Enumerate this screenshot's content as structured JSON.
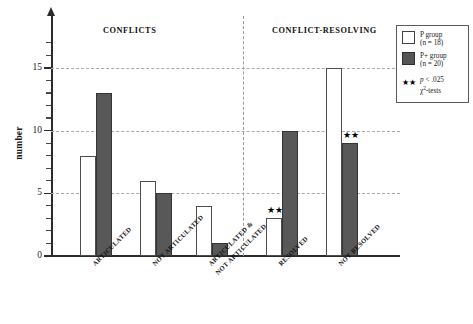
{
  "chart_data": {
    "type": "bar",
    "title": "",
    "xlabel": "",
    "ylabel": "number",
    "ylim": [
      0,
      17
    ],
    "yticks": [
      0,
      5,
      10,
      15
    ],
    "ytick_labels": [
      "0",
      "5",
      "10",
      "15"
    ],
    "minor_tick_step": 1,
    "grid": "horizontal-dashed at 5, 10, 15",
    "legend_position": "outside-right-top",
    "sections": [
      {
        "label": "CONFLICTS",
        "categories": [
          "ARTICULATED",
          "NOT ARTICULATED",
          "ARTICULATED & NOT ARTICULATED"
        ]
      },
      {
        "label": "CONFLICT-RESOLVING",
        "categories": [
          "RESOLVED",
          "NOT RESOLVED"
        ]
      }
    ],
    "categories": [
      "ARTICULATED",
      "NOT ARTICULATED",
      "ARTICULATED & NOT ARTICULATED",
      "RESOLVED",
      "NOT RESOLVED"
    ],
    "category_lines": [
      [
        "ARTICULATED"
      ],
      [
        "NOT ARTICULATED"
      ],
      [
        "ARTICULATED &",
        "NOT ARTICULATED"
      ],
      [
        "RESOLVED"
      ],
      [
        "NOT RESOLVED"
      ]
    ],
    "series": [
      {
        "name": "P group",
        "n": 18,
        "color": "#ffffff",
        "edge": "#4d4d4d",
        "values": [
          8,
          6,
          4,
          3,
          15
        ]
      },
      {
        "name": "P+ group",
        "n": 20,
        "color": "#585858",
        "edge": "#343434",
        "values": [
          13,
          5,
          1,
          10,
          9
        ]
      }
    ],
    "annotations": [
      {
        "marker": "★★",
        "category": "RESOLVED",
        "series": "P group",
        "value": 3
      },
      {
        "marker": "★★",
        "category": "NOT RESOLVED",
        "series": "P+ group",
        "value": 9
      }
    ]
  },
  "axis": {
    "y_title": "number",
    "y_tick_labels": [
      "0",
      "5",
      "10",
      "15"
    ]
  },
  "headers": {
    "left": "CONFLICTS",
    "right": "CONFLICT-RESOLVING"
  },
  "legend": {
    "entries": [
      {
        "label": "P group",
        "sub": "(n = 18)",
        "swatch": "light"
      },
      {
        "label": "P+ group",
        "sub": "(n = 20)",
        "swatch": "dark"
      }
    ],
    "significance": {
      "marker": "★★",
      "line1_prefix": "p",
      "line1_rest": " < .025",
      "line2_prefix": "χ",
      "line2_sup": "2",
      "line2_rest": "-tests"
    }
  },
  "labels": {
    "cat_0_l0": "ARTICULATED",
    "cat_1_l0": "NOT ARTICULATED",
    "cat_2_l0": "ARTICULATED &",
    "cat_2_l1": "NOT ARTICULATED",
    "cat_3_l0": "RESOLVED",
    "cat_4_l0": "NOT RESOLVED",
    "star": "★★"
  }
}
